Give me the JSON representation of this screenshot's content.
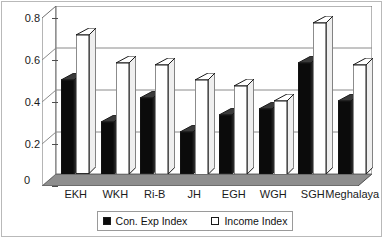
{
  "chart_data": {
    "type": "bar",
    "title": "",
    "subtitle": "",
    "xlabel": "",
    "ylabel": "",
    "categories": [
      "EKH",
      "WKH",
      "Ri-B",
      "JH",
      "EGH",
      "WGH",
      "SGH",
      "Meghalaya"
    ],
    "series": [
      {
        "name": "Con. Exp Index",
        "color": "#0b0b0b",
        "values": [
          0.45,
          0.25,
          0.36,
          0.2,
          0.28,
          0.31,
          0.53,
          0.35
        ]
      },
      {
        "name": "Income Index",
        "color": "#ffffff",
        "values": [
          0.66,
          0.53,
          0.52,
          0.45,
          0.42,
          0.35,
          0.72,
          0.52
        ]
      }
    ],
    "ylim": [
      0,
      0.8
    ],
    "yticks": [
      0,
      0.2,
      0.4,
      0.6,
      0.8
    ],
    "ytick_labels": [
      "0",
      "0.2",
      "0.4",
      "0.6",
      "0.8"
    ],
    "grid": true,
    "grid_axis": "y",
    "legend_position": "bottom",
    "style": "3d-column",
    "legend": [
      "Con. Exp Index",
      "Income Index"
    ]
  },
  "axis": {
    "zero_label": "0"
  }
}
